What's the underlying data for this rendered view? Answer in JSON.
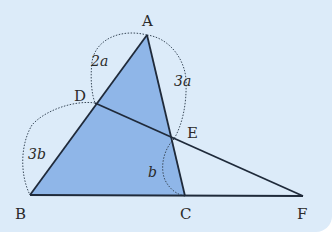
{
  "diagram": {
    "colors": {
      "background": "#dcebf9",
      "fill": "#8fb6e8",
      "stroke": "#1f2a3a",
      "arc": "#3a4a5a"
    },
    "points": {
      "A": {
        "label": "A",
        "x": 147,
        "y": 35
      },
      "B": {
        "label": "B",
        "x": 30,
        "y": 195
      },
      "C": {
        "label": "C",
        "x": 185,
        "y": 196
      },
      "D": {
        "label": "D",
        "x": 95,
        "y": 103
      },
      "E": {
        "label": "E",
        "x": 174,
        "y": 139
      },
      "F": {
        "label": "F",
        "x": 303,
        "y": 196
      }
    },
    "segments_labels": {
      "AD": "2a",
      "AE": "3a",
      "DB": "3b",
      "EC": "b"
    },
    "shaded_region": "triangle ABC",
    "lines": [
      "AB",
      "AC",
      "BF",
      "DF"
    ]
  }
}
